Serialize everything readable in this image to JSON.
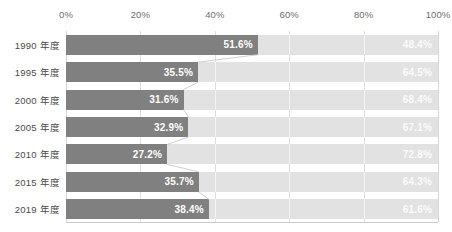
{
  "chart_data": {
    "type": "bar",
    "subtype": "100% stacked horizontal bar",
    "title": "",
    "xlabel": "",
    "ylabel": "",
    "xlim": [
      0,
      100
    ],
    "grid": true,
    "legend": "none",
    "xticks": [
      "0%",
      "20%",
      "40%",
      "60%",
      "80%",
      "100%"
    ],
    "xtick_values": [
      0,
      20,
      40,
      60,
      80,
      100
    ],
    "categories": [
      "1990 年度",
      "1995 年度",
      "2000 年度",
      "2005 年度",
      "2010 年度",
      "2015 年度",
      "2019 年度"
    ],
    "series": [
      {
        "name": "left-segment",
        "color": "#808080",
        "values": [
          51.6,
          35.5,
          31.6,
          32.9,
          27.2,
          35.7,
          38.4
        ],
        "labels": [
          "51.6%",
          "35.5%",
          "31.6%",
          "32.9%",
          "27.2%",
          "35.7%",
          "38.4%"
        ]
      },
      {
        "name": "right-segment",
        "color": "#e2e2e2",
        "values": [
          48.4,
          64.5,
          68.4,
          67.1,
          72.8,
          64.3,
          61.6
        ],
        "labels": [
          "48.4%",
          "64.5%",
          "68.4%",
          "67.1%",
          "72.8%",
          "64.3%",
          "61.6%"
        ]
      }
    ]
  },
  "colors": {
    "left_bar": "#808080",
    "right_bar": "#e2e2e2",
    "left_value_text": "#ffffff",
    "right_value_text": "#fbfbfb",
    "axis_text": "#6d6d6d",
    "category_text": "#4a4a4a",
    "gridline": "#dedede",
    "connector": "#c8c8c8",
    "background": "#ffffff"
  }
}
